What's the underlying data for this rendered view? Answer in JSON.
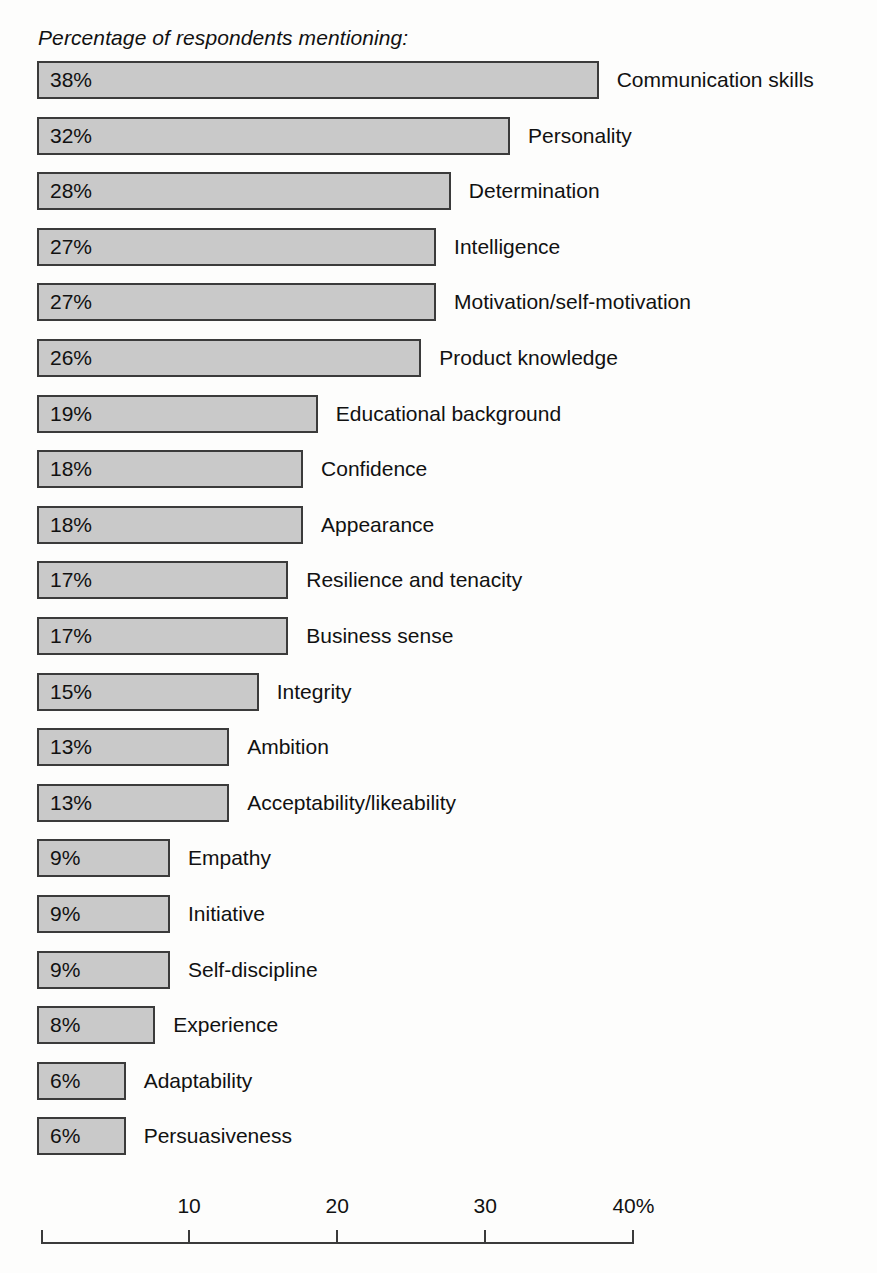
{
  "chart_data": {
    "type": "bar",
    "title": "Percentage of respondents mentioning:",
    "orientation": "horizontal",
    "xlabel": "",
    "ylabel": "",
    "xlim": [
      0,
      40
    ],
    "grid": false,
    "legend": null,
    "unit": "%",
    "axis": {
      "ticks": [
        10,
        20,
        30,
        40
      ],
      "tick_labels": [
        "10",
        "20",
        "30",
        "40%"
      ],
      "origin_label": ""
    },
    "categories": [
      "Communication skills",
      "Personality",
      "Determination",
      "Intelligence",
      "Motivation/self-motivation",
      "Product knowledge",
      "Educational background",
      "Confidence",
      "Appearance",
      "Resilience and tenacity",
      "Business sense",
      "Integrity",
      "Ambition",
      "Acceptability/likeability",
      "Empathy",
      "Initiative",
      "Self-discipline",
      "Experience",
      "Adaptability",
      "Persuasiveness"
    ],
    "values": [
      38,
      32,
      28,
      27,
      27,
      26,
      19,
      18,
      18,
      17,
      17,
      15,
      13,
      13,
      9,
      9,
      9,
      8,
      6,
      6
    ],
    "value_labels": [
      "38%",
      "32%",
      "28%",
      "27%",
      "27%",
      "26%",
      "19%",
      "18%",
      "18%",
      "17%",
      "17%",
      "15%",
      "13%",
      "13%",
      "9%",
      "9%",
      "9%",
      "8%",
      "6%",
      "6%"
    ],
    "colors": {
      "bar_fill": "#c9c9c9",
      "bar_stroke": "#3b3b3b",
      "text": "#111111",
      "background": "#fdfdfc"
    }
  }
}
